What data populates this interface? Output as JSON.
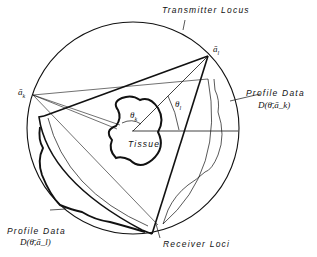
{
  "diagram": {
    "labels": {
      "transmitter_locus": "Transmitter Locus",
      "receiver_loci": "Receiver Loci",
      "tissue": "Tissue",
      "profile_data_right": "Profile Data",
      "profile_data_right_formula": "D(θ̄,ā_k)",
      "profile_data_left": "Profile Data",
      "profile_data_left_formula": "D(θ̄,ā_l)",
      "point_l": "ā",
      "point_l_sub": "l",
      "point_k": "ā",
      "point_k_sub": "k",
      "theta_l": "θ",
      "theta_l_sub": "l",
      "theta_k": "θ",
      "theta_k_sub": "k"
    },
    "colors": {
      "stroke": "#111111",
      "background": "#ffffff"
    }
  }
}
